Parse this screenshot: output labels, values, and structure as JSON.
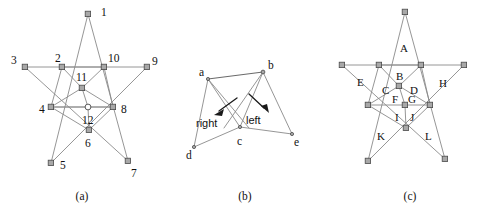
{
  "figure": {
    "background_color": "#ffffff",
    "line_color": "#8a8a8a",
    "node_fill": "#a8a8a8",
    "text_color": "#111111",
    "panels": [
      {
        "id": "a",
        "caption": "(a)",
        "caption_x": 82,
        "caption_y": 196,
        "kind": "pentagram-numbered",
        "description": "Pentagram with numbered vertices and interior intersection points",
        "vertices": [
          {
            "label": "1",
            "x": 88,
            "y": 14,
            "lx": 101,
            "ly": 11,
            "marker": "square"
          },
          {
            "label": "2",
            "x": 62,
            "y": 67,
            "lx": 55,
            "ly": 61,
            "marker": "square"
          },
          {
            "label": "3",
            "x": 25,
            "y": 67,
            "lx": 12,
            "ly": 61,
            "marker": "square"
          },
          {
            "label": "4",
            "x": 51,
            "y": 107,
            "lx": 40,
            "ly": 110,
            "marker": "square"
          },
          {
            "label": "5",
            "x": 51,
            "y": 163,
            "lx": 61,
            "ly": 166,
            "marker": "square"
          },
          {
            "label": "6",
            "x": 89,
            "y": 130,
            "lx": 86,
            "ly": 143,
            "marker": "square"
          },
          {
            "label": "7",
            "x": 128,
            "y": 161,
            "lx": 132,
            "ly": 173,
            "marker": "square"
          },
          {
            "label": "8",
            "x": 113,
            "y": 107,
            "lx": 122,
            "ly": 110,
            "marker": "square"
          },
          {
            "label": "9",
            "x": 147,
            "y": 67,
            "lx": 153,
            "ly": 62,
            "marker": "square"
          },
          {
            "label": "10",
            "x": 104,
            "y": 67,
            "lx": 109,
            "ly": 61,
            "marker": "square"
          },
          {
            "label": "11",
            "x": 82,
            "y": 88,
            "lx": 79,
            "ly": 78,
            "marker": "square"
          },
          {
            "label": "12",
            "x": 88,
            "y": 107,
            "lx": 85,
            "ly": 121,
            "marker": "circle"
          }
        ]
      },
      {
        "id": "b",
        "caption": "(b)",
        "caption_x": 245,
        "caption_y": 196,
        "kind": "quadrilateral-split",
        "description": "Two triangles sharing a boundary, labelled right and left, with arrows",
        "vertices": [
          {
            "label": "a",
            "x": 208,
            "y": 79,
            "lx": 200,
            "ly": 73
          },
          {
            "label": "b",
            "x": 263,
            "y": 72,
            "lx": 269,
            "ly": 66
          },
          {
            "label": "c",
            "x": 240,
            "y": 127,
            "lx": 240,
            "ly": 141
          },
          {
            "label": "d",
            "x": 194,
            "y": 147,
            "lx": 189,
            "ly": 155
          },
          {
            "label": "e",
            "x": 292,
            "y": 134,
            "lx": 296,
            "ly": 142
          }
        ],
        "region_labels": [
          {
            "text": "right",
            "x": 209,
            "y": 123
          },
          {
            "text": "left",
            "x": 256,
            "y": 120
          }
        ],
        "arrows": [
          {
            "from_x": 236,
            "from_y": 99,
            "to_x": 215,
            "to_y": 113
          },
          {
            "from_x": 249,
            "from_y": 94,
            "to_x": 266,
            "to_y": 110
          }
        ]
      },
      {
        "id": "c",
        "caption": "(c)",
        "caption_x": 410,
        "caption_y": 196,
        "kind": "pentagram-regions",
        "description": "Pentagram with lettered face regions A through L",
        "vertices": [
          {
            "x": 405,
            "y": 12,
            "marker": "square"
          },
          {
            "x": 379,
            "y": 65,
            "marker": "square"
          },
          {
            "x": 342,
            "y": 65,
            "marker": "square"
          },
          {
            "x": 368,
            "y": 105,
            "marker": "square"
          },
          {
            "x": 368,
            "y": 161,
            "marker": "square"
          },
          {
            "x": 406,
            "y": 128,
            "marker": "square"
          },
          {
            "x": 445,
            "y": 159,
            "marker": "square"
          },
          {
            "x": 430,
            "y": 105,
            "marker": "square"
          },
          {
            "x": 464,
            "y": 65,
            "marker": "square"
          },
          {
            "x": 421,
            "y": 65,
            "marker": "square"
          },
          {
            "x": 399,
            "y": 86,
            "marker": "square"
          },
          {
            "x": 405,
            "y": 105,
            "marker": "square"
          }
        ],
        "region_labels": [
          {
            "text": "A",
            "x": 404,
            "y": 48
          },
          {
            "text": "B",
            "x": 400,
            "y": 76
          },
          {
            "text": "C",
            "x": 386,
            "y": 90
          },
          {
            "text": "D",
            "x": 414,
            "y": 90
          },
          {
            "text": "E",
            "x": 361,
            "y": 82
          },
          {
            "text": "F",
            "x": 396,
            "y": 99
          },
          {
            "text": "G",
            "x": 412,
            "y": 99
          },
          {
            "text": "H",
            "x": 443,
            "y": 83
          },
          {
            "text": "I",
            "x": 397,
            "y": 117
          },
          {
            "text": "J",
            "x": 413,
            "y": 117
          },
          {
            "text": "K",
            "x": 381,
            "y": 136
          },
          {
            "text": "L",
            "x": 429,
            "y": 136
          }
        ]
      }
    ]
  }
}
